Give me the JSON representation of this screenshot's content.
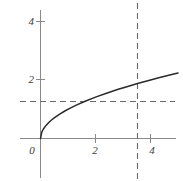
{
  "chart_data": {
    "type": "line",
    "title": "",
    "subtitle": "",
    "xlabel": "",
    "ylabel": "",
    "function": "y = sqrt(x)",
    "grid": false,
    "legend": null,
    "xlim": [
      -0.7,
      5.2
    ],
    "ylim": [
      -1.45,
      5.15
    ],
    "x_ticks": [
      0,
      2,
      4
    ],
    "y_ticks": [
      2,
      4
    ],
    "x_tick_labels": [
      "0",
      "2",
      "4"
    ],
    "y_tick_labels": [
      "2",
      "4"
    ],
    "axis_color": "#8a8a8a",
    "curve_color": "#2b2b2b",
    "dashed_color": "#6a6a6a",
    "series": [
      {
        "name": "sqrt-curve",
        "style": "solid",
        "x": [
          0,
          0.05,
          0.1,
          0.2,
          0.3,
          0.4,
          0.5,
          0.7,
          0.9,
          1.1,
          1.3,
          1.6,
          2.0,
          2.4,
          2.8,
          3.2,
          3.53,
          3.9,
          4.3,
          4.7,
          5.0
        ],
        "y": [
          0,
          0.224,
          0.316,
          0.447,
          0.548,
          0.632,
          0.707,
          0.837,
          0.949,
          1.049,
          1.14,
          1.265,
          1.414,
          1.549,
          1.673,
          1.789,
          1.879,
          1.975,
          2.074,
          2.168,
          2.236
        ]
      }
    ],
    "reference_lines": [
      {
        "name": "horizontal-dashed-reference",
        "orientation": "horizontal",
        "value": 1.27,
        "style": "dashed",
        "x_start": -0.7,
        "x_end": 4.9
      },
      {
        "name": "vertical-dashed-reference",
        "orientation": "vertical",
        "value": 3.53,
        "style": "dashed",
        "y_start": -1.45,
        "y_end": 5.15
      }
    ],
    "intersection_point": {
      "x": 3.53,
      "y": 1.27
    }
  },
  "labels": {
    "x0": "0",
    "x2": "2",
    "x4": "4",
    "y2": "2",
    "y4": "4"
  }
}
